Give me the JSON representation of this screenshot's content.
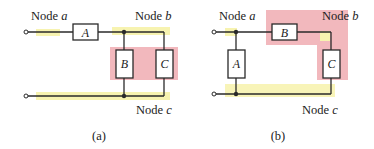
{
  "colors": {
    "wire": "#2a2a2a",
    "node_highlight_yellow": "#f7f3b0",
    "node_highlight_pink": "#f2b8bd",
    "background": "#ffffff"
  },
  "diagram_a": {
    "caption": "(a)",
    "node_labels": {
      "a": {
        "prefix": "Node ",
        "var": "a"
      },
      "b": {
        "prefix": "Node ",
        "var": "b"
      },
      "c": {
        "prefix": "Node ",
        "var": "c"
      }
    },
    "elements": {
      "A": "A",
      "B": "B",
      "C": "C"
    }
  },
  "diagram_b": {
    "caption": "(b)",
    "node_labels": {
      "a": {
        "prefix": "Node ",
        "var": "a"
      },
      "b": {
        "prefix": "Node ",
        "var": "b"
      },
      "c": {
        "prefix": "Node ",
        "var": "c"
      }
    },
    "elements": {
      "A": "A",
      "B": "B",
      "C": "C"
    }
  }
}
